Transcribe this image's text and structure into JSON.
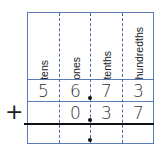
{
  "headers": [
    "tens",
    "ones",
    "tenths",
    "hundredths"
  ],
  "row1": [
    "5",
    "6",
    "7",
    "3"
  ],
  "row2": [
    "",
    "0",
    "3",
    "7"
  ],
  "row3": [
    "",
    "",
    "",
    ""
  ],
  "operator": "+",
  "colors": {
    "grid": "#5a7ab8",
    "sum_line": "#111111"
  }
}
